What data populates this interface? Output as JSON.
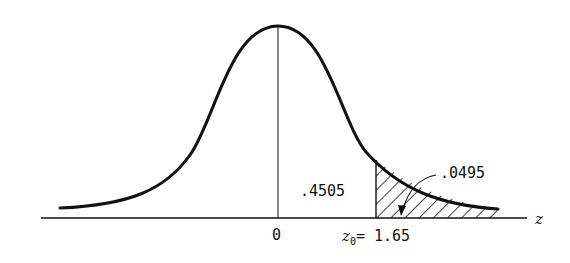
{
  "diagram": {
    "type": "normal-distribution-curve",
    "mean_label": "0",
    "axis_label": "z",
    "z0_label_var": "z",
    "z0_label_sub": "0",
    "z0_label_eq": "= 1.65",
    "area_center_to_z0": ".4505",
    "area_tail": ".0495",
    "colors": {
      "stroke": "#111111",
      "background": "#ffffff"
    }
  }
}
